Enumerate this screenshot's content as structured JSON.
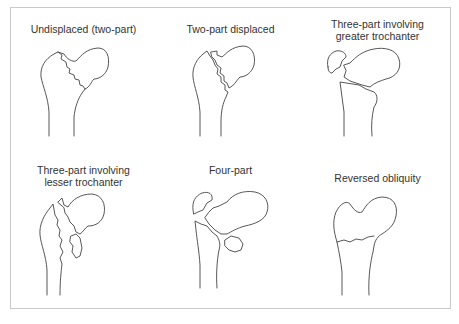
{
  "figure": {
    "panels": [
      {
        "id": "undisplaced",
        "label": "Undisplaced (two-part)"
      },
      {
        "id": "two-part-displaced",
        "label": "Two-part displaced"
      },
      {
        "id": "three-part-greater",
        "label": "Three-part involving greater trochanter"
      },
      {
        "id": "three-part-lesser",
        "label": "Three-part involving lesser trochanter"
      },
      {
        "id": "four-part",
        "label": "Four-part"
      },
      {
        "id": "reversed-obliquity",
        "label": "Reversed obliquity"
      }
    ]
  }
}
